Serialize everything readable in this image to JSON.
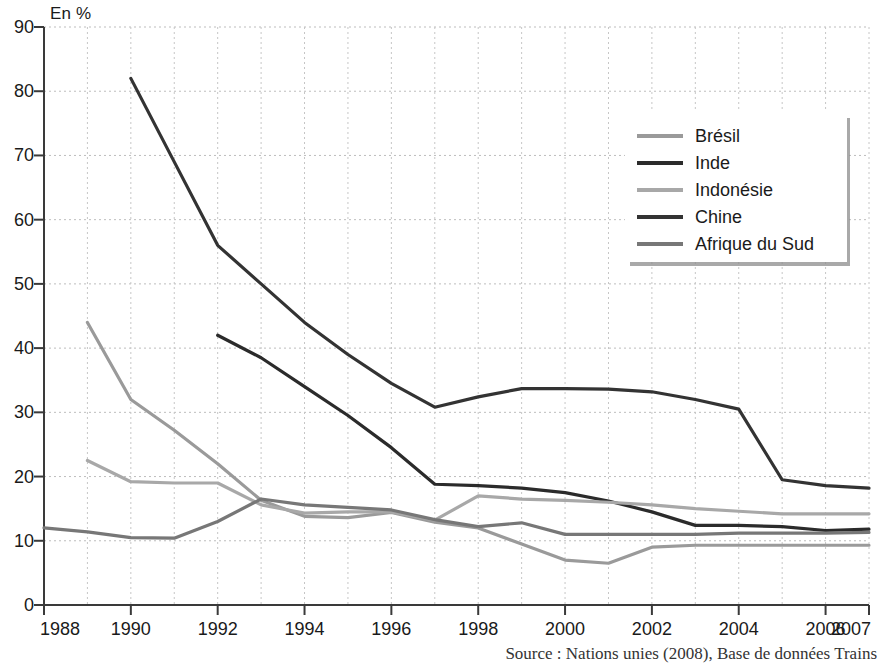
{
  "axis_unit": "En %",
  "source": "Source : Nations unies (2008), Base de données Trains",
  "legend": {
    "items": [
      {
        "label": "Brésil",
        "color": "#9a9a9a"
      },
      {
        "label": "Inde",
        "color": "#2b2b2b"
      },
      {
        "label": "Indonésie",
        "color": "#a8a8a8"
      },
      {
        "label": "Chine",
        "color": "#333333"
      },
      {
        "label": "Afrique du Sud",
        "color": "#777777"
      }
    ]
  },
  "yticks": [
    "0",
    "10",
    "20",
    "30",
    "40",
    "50",
    "60",
    "70",
    "80",
    "90"
  ],
  "xticks": [
    "1988",
    "1990",
    "1992",
    "1994",
    "1996",
    "1998",
    "2000",
    "2002",
    "2004",
    "2006",
    "2007"
  ],
  "chart_data": {
    "type": "line",
    "title": "",
    "subtitle": "",
    "xlabel": "",
    "ylabel": "En %",
    "xlim": [
      1988,
      2007
    ],
    "ylim": [
      0,
      90
    ],
    "ytick_step": 10,
    "grid": true,
    "grid_style": "dotted",
    "legend_position": "top-right",
    "x": [
      1988,
      1989,
      1990,
      1991,
      1992,
      1993,
      1994,
      1995,
      1996,
      1997,
      1998,
      1999,
      2000,
      2001,
      2002,
      2003,
      2004,
      2005,
      2006,
      2007
    ],
    "series": [
      {
        "name": "Brésil",
        "color": "#9a9a9a",
        "x": [
          1989,
          1990,
          1991,
          1992,
          1993,
          1994,
          1995,
          1996,
          1997,
          1998,
          1999,
          2000,
          2001,
          2002,
          2003,
          2004,
          2005,
          2006,
          2007
        ],
        "values": [
          44.0,
          32.0,
          27.2,
          22.0,
          16.3,
          13.8,
          13.6,
          14.4,
          12.9,
          12.0,
          9.5,
          7.0,
          6.5,
          9.0,
          9.3,
          9.3,
          9.3,
          9.3,
          9.3
        ]
      },
      {
        "name": "Inde",
        "color": "#2b2b2b",
        "x": [
          1992,
          1993,
          1994,
          1995,
          1996,
          1997,
          1998,
          1999,
          2000,
          2001,
          2002,
          2003,
          2004,
          2005,
          2006,
          2007
        ],
        "values": [
          42.0,
          38.5,
          34.0,
          29.5,
          24.5,
          18.8,
          18.6,
          18.2,
          17.5,
          16.2,
          14.5,
          12.4,
          12.4,
          12.2,
          11.6,
          11.8
        ]
      },
      {
        "name": "Indonésie",
        "color": "#a8a8a8",
        "x": [
          1989,
          1990,
          1991,
          1992,
          1993,
          1994,
          1995,
          1996,
          1997,
          1998,
          1999,
          2000,
          2001,
          2002,
          2003,
          2004,
          2005,
          2006,
          2007
        ],
        "values": [
          22.5,
          19.2,
          19.0,
          19.0,
          15.6,
          14.3,
          14.5,
          14.5,
          13.2,
          17.0,
          16.5,
          16.3,
          16.0,
          15.6,
          15.0,
          14.6,
          14.2,
          14.2,
          14.2
        ]
      },
      {
        "name": "Chine",
        "color": "#333333",
        "x": [
          1990,
          1991,
          1992,
          1993,
          1994,
          1995,
          1996,
          1997,
          1998,
          1999,
          2000,
          2001,
          2002,
          2003,
          2004,
          2005,
          2006,
          2007
        ],
        "values": [
          82.0,
          69.0,
          56.0,
          50.0,
          44.0,
          39.0,
          34.5,
          30.8,
          32.4,
          33.7,
          33.7,
          33.6,
          33.2,
          32.0,
          30.5,
          19.5,
          18.6,
          18.2
        ]
      },
      {
        "name": "Afrique du Sud",
        "color": "#777777",
        "x": [
          1988,
          1989,
          1990,
          1991,
          1992,
          1993,
          1994,
          1995,
          1996,
          1997,
          1998,
          1999,
          2000,
          2001,
          2002,
          2003,
          2004,
          2005,
          2006,
          2007
        ],
        "values": [
          12.0,
          11.4,
          10.5,
          10.4,
          13.0,
          16.5,
          15.6,
          15.2,
          14.8,
          13.3,
          12.2,
          12.8,
          11.0,
          11.0,
          11.0,
          11.0,
          11.2,
          11.2,
          11.2,
          11.3
        ]
      }
    ]
  }
}
